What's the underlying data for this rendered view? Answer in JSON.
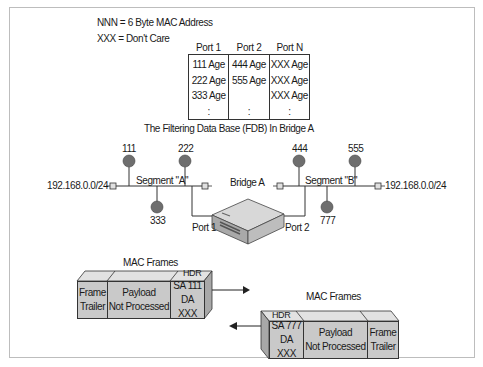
{
  "legend": {
    "line1": "NNN = 6 Byte MAC Address",
    "line2": "XXX = Don't Care"
  },
  "fdb": {
    "caption": "The Filtering Data Base (FDB) In Bridge A",
    "columns": [
      {
        "header": "Port 1",
        "rows": [
          "111 Age",
          "222 Age",
          "333 Age",
          ":"
        ]
      },
      {
        "header": "Port 2",
        "rows": [
          "444 Age",
          "555 Age",
          "",
          ":"
        ]
      },
      {
        "header": "Port N",
        "rows": [
          "XXX Age",
          "XXX Age",
          "XXX Age",
          ":"
        ]
      }
    ]
  },
  "network": {
    "segment_a": {
      "label": "Segment \"A\"",
      "subnet": "192.168.0.0/24",
      "hosts": [
        "111",
        "222",
        "333"
      ],
      "port_label": "Port 1"
    },
    "segment_b": {
      "label": "Segment \"B\"",
      "subnet": "192.168.0.0/24",
      "hosts": [
        "444",
        "555",
        "777"
      ],
      "port_label": "Port 2"
    },
    "bridge_label": "Bridge A"
  },
  "frames": {
    "incoming": {
      "title": "MAC Frames",
      "hdr_label": "HDR",
      "trailer": [
        "Frame",
        "Trailer"
      ],
      "payload": [
        "Payload",
        "Not Processed"
      ],
      "header": [
        "SA 111",
        "DA XXX"
      ]
    },
    "outgoing": {
      "title": "MAC Frames",
      "hdr_label": "HDR",
      "header": [
        "SA 777",
        "DA XXX"
      ],
      "payload": [
        "Payload",
        "Not Processed"
      ],
      "trailer": [
        "Frame",
        "Trailer"
      ]
    }
  },
  "colors": {
    "host": "#6e6e6e",
    "frame_fill": "#c9c9c9",
    "line": "#333333"
  }
}
